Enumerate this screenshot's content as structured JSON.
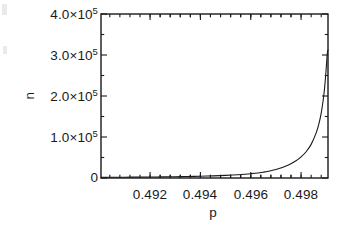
{
  "figure": {
    "kind": "scientific-plot",
    "background_color": "#ffffff",
    "ink_color": "#1a1a1a"
  },
  "chart_data": {
    "type": "line",
    "title": "",
    "subtitle": "",
    "xlabel": "p",
    "ylabel": "n",
    "xlim": [
      0.49005,
      0.49907
    ],
    "ylim": [
      0,
      400000
    ],
    "grid": false,
    "legend": null,
    "legend_position": "none",
    "x_ticks": [
      0.492,
      0.494,
      0.496,
      0.498
    ],
    "x_tick_labels": [
      "0.492",
      "0.494",
      "0.496",
      "0.498"
    ],
    "x_minor_tick_count_per_major": 4,
    "y_ticks": [
      0,
      100000,
      200000,
      300000,
      400000
    ],
    "y_tick_labels": [
      "0",
      "1.0×10",
      "2.0×10",
      "3.0×10",
      "4.0×10"
    ],
    "y_tick_exponent": "5",
    "y_minor_tick_count_per_major": 1,
    "axes_frame": "box",
    "tick_direction": "in",
    "series": [
      {
        "name": "n(p)",
        "color": "#1a1a1a",
        "line_width": 1.1,
        "marker": "none",
        "description": "divergent growth approaching critical p",
        "x": [
          0.49005,
          0.4905,
          0.491,
          0.4915,
          0.492,
          0.4925,
          0.493,
          0.4935,
          0.494,
          0.4945,
          0.495,
          0.4955,
          0.496,
          0.4965,
          0.497,
          0.4975,
          0.4978,
          0.498,
          0.4982,
          0.4984,
          0.4986,
          0.4987,
          0.4988,
          0.4989,
          0.49895,
          0.499,
          0.49903,
          0.49905,
          0.49907
        ],
        "y": [
          1600,
          1750,
          1950,
          2180,
          2450,
          2780,
          3180,
          3700,
          4350,
          5200,
          6350,
          8000,
          10500,
          14200,
          20500,
          32000,
          42000,
          51500,
          64000,
          82000,
          110000,
          130000,
          158000,
          200000,
          230000,
          268000,
          295000,
          308000,
          312000
        ]
      }
    ],
    "annotations": []
  },
  "axis_labels": {
    "y_tick_4": {
      "mantissa": "4.0×10",
      "exponent": "5"
    },
    "y_tick_3": {
      "mantissa": "3.0×10",
      "exponent": "5"
    },
    "y_tick_2": {
      "mantissa": "2.0×10",
      "exponent": "5"
    },
    "y_tick_1": {
      "mantissa": "1.0×10",
      "exponent": "5"
    },
    "y_tick_0": {
      "mantissa": "0",
      "exponent": ""
    },
    "x_tick_0": "0.492",
    "x_tick_1": "0.494",
    "x_tick_2": "0.496",
    "x_tick_3": "0.498",
    "x_axis_title": "p",
    "y_axis_title": "n"
  }
}
